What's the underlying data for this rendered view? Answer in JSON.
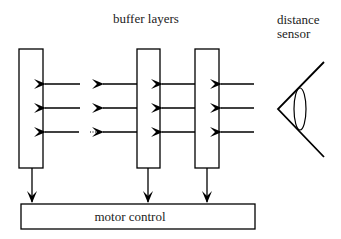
{
  "labels": {
    "buffer_layers": "buffer layers",
    "distance_line1": "distance",
    "distance_line2": "sensor",
    "motor_control": "motor control"
  },
  "components": {
    "buffer_layers": [
      {
        "name": "buffer-layer-1",
        "x": 19,
        "y": 49,
        "w": 24,
        "h": 119
      },
      {
        "name": "buffer-layer-2",
        "x": 137,
        "y": 49,
        "w": 23,
        "h": 119
      },
      {
        "name": "buffer-layer-3",
        "x": 195,
        "y": 49,
        "w": 24,
        "h": 119
      }
    ],
    "motor_control_box": {
      "x": 21,
      "y": 204,
      "w": 234,
      "h": 25
    },
    "sensor_icon": "eye-icon",
    "ellipsis": "..."
  },
  "colors": {
    "stroke": "#000000",
    "text": "#222222",
    "background": "#ffffff"
  }
}
